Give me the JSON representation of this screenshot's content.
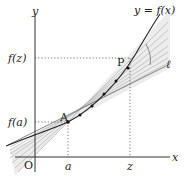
{
  "diagram": {
    "axes": {
      "x_label": "x",
      "y_label": "y",
      "origin_label": "O"
    },
    "curve_label": "y = f(x)",
    "tangent_label": "ℓ",
    "points": {
      "A": {
        "label": "A",
        "x_tick": "a",
        "y_tick": "f(a)"
      },
      "P": {
        "label": "P",
        "x_tick": "z",
        "y_tick": "f(z)"
      }
    },
    "colors": {
      "axis": "#333333",
      "curve": "#222222",
      "secants": "#b0b0b0",
      "fill": "#e6e6e6",
      "guides": "#555555"
    }
  }
}
